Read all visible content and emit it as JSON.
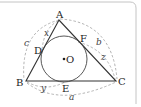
{
  "diagram": {
    "colors": {
      "line": "#333333",
      "dashed": "#999999",
      "frame": "#bbbbbb",
      "background": "#ffffff"
    },
    "points": {
      "A": {
        "label": "A",
        "x": 59,
        "y": 20
      },
      "B": {
        "label": "B",
        "x": 26,
        "y": 81
      },
      "C": {
        "label": "C",
        "x": 116,
        "y": 81
      },
      "D": {
        "label": "D",
        "x": 43,
        "y": 51
      },
      "E": {
        "label": "E",
        "x": 66,
        "y": 81
      },
      "F": {
        "label": "F",
        "x": 78,
        "y": 43
      },
      "O": {
        "label": "O",
        "x": 64,
        "y": 59
      }
    },
    "incircle": {
      "cx": 64,
      "cy": 59,
      "r": 23
    },
    "segment_labels": {
      "x": "x",
      "y": "y",
      "z": "z",
      "a": "a",
      "b": "b",
      "c": "c"
    }
  }
}
